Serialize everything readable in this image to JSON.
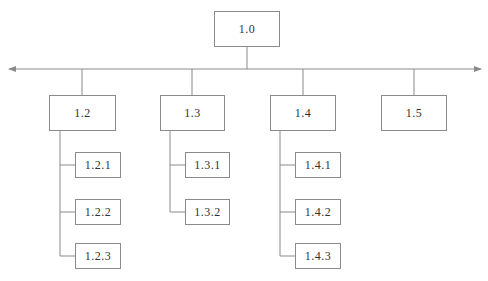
{
  "diagram": {
    "type": "work-breakdown-structure",
    "root": {
      "label": "1.0"
    },
    "axis": {
      "arrows": "both-ends"
    },
    "branches": [
      {
        "label": "1.2",
        "children": [
          "1.2.1",
          "1.2.2",
          "1.2.3"
        ]
      },
      {
        "label": "1.3",
        "children": [
          "1.3.1",
          "1.3.2"
        ]
      },
      {
        "label": "1.4",
        "children": [
          "1.4.1",
          "1.4.2",
          "1.4.3"
        ]
      },
      {
        "label": "1.5",
        "children": []
      }
    ],
    "colors": {
      "line": "#8a8a8a",
      "text": "#333333",
      "background": "#ffffff"
    }
  }
}
